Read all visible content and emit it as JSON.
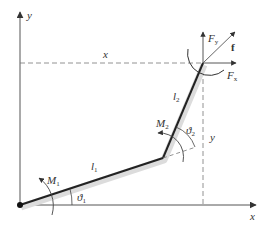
{
  "diagram": {
    "type": "two-link planar manipulator",
    "colors": {
      "axis": "#555555",
      "link": "#222222",
      "link_shadow": "#d8d8d8",
      "dashed": "#777777",
      "text": "#333333"
    },
    "axes": {
      "x_label": "x",
      "y_label": "y"
    },
    "links": [
      {
        "name": "l",
        "sub": "1"
      },
      {
        "name": "l",
        "sub": "2"
      }
    ],
    "joints": {
      "base_angle": {
        "sym": "ϑ",
        "sub": "1"
      },
      "elbow_angle": {
        "sym": "ϑ",
        "sub": "2"
      },
      "base_moment": {
        "sym": "M",
        "sub": "1"
      },
      "elbow_moment": {
        "sym": "M",
        "sub": "2"
      }
    },
    "end_effector": {
      "force_vector": "f",
      "force_x": {
        "sym": "F",
        "sub": "x"
      },
      "force_y": {
        "sym": "F",
        "sub": "y"
      }
    },
    "dimensions": {
      "x_dim": "x",
      "y_dim": "y"
    }
  }
}
